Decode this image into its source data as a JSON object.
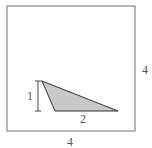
{
  "figure": {
    "outer_square": {
      "side_label": "4",
      "bottom_label": "4"
    },
    "triangle": {
      "height_label": "1",
      "base_label": "2",
      "fill": "#c8c8c8",
      "stroke": "#333333"
    }
  }
}
